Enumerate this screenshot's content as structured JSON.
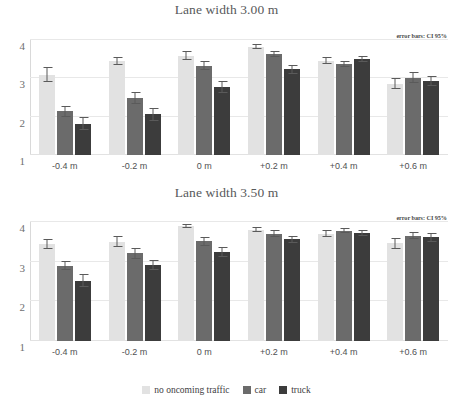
{
  "figure": {
    "legend": {
      "items": [
        {
          "label": "no oncoming traffic",
          "color": "#e2e2e2"
        },
        {
          "label": "car",
          "color": "#6b6b6b"
        },
        {
          "label": "truck",
          "color": "#3c3c3c"
        }
      ]
    },
    "annotation": "error bars: CI 95%"
  },
  "chart_data": [
    {
      "type": "bar",
      "title": "Lane width 3.00 m",
      "xlabel": "",
      "ylabel": "",
      "ylim": [
        1,
        4
      ],
      "yticks": [
        1,
        2,
        3,
        4
      ],
      "ytick_labels": [
        "1",
        "2",
        "3",
        "4"
      ],
      "grid": true,
      "legend_position": "bottom",
      "annotation": "error bars: CI 95%",
      "categories": [
        "-0.4 m",
        "-0.2 m",
        "0 m",
        "+0.2 m",
        "+0.4 m",
        "+0.6 m"
      ],
      "series": [
        {
          "name": "no oncoming traffic",
          "color": "#e2e2e2",
          "values": [
            3.08,
            3.45,
            3.58,
            3.82,
            3.46,
            2.86
          ],
          "err_low": [
            2.9,
            3.36,
            3.47,
            3.76,
            3.38,
            2.71
          ],
          "err_high": [
            3.3,
            3.55,
            3.72,
            3.89,
            3.55,
            3.02
          ]
        },
        {
          "name": "car",
          "color": "#6b6b6b",
          "values": [
            2.14,
            2.48,
            3.33,
            3.63,
            3.38,
            3.01
          ],
          "err_low": [
            2.0,
            2.32,
            3.22,
            3.55,
            3.3,
            2.87
          ],
          "err_high": [
            2.29,
            2.65,
            3.45,
            3.71,
            3.46,
            3.16
          ]
        },
        {
          "name": "truck",
          "color": "#3c3c3c",
          "values": [
            1.82,
            2.06,
            2.77,
            3.24,
            3.5,
            2.94
          ],
          "err_low": [
            1.66,
            1.9,
            2.63,
            3.12,
            3.42,
            2.81
          ],
          "err_high": [
            1.98,
            2.22,
            2.92,
            3.36,
            3.58,
            3.07
          ]
        }
      ]
    },
    {
      "type": "bar",
      "title": "Lane width 3.50 m",
      "xlabel": "",
      "ylabel": "",
      "ylim": [
        1,
        4
      ],
      "yticks": [
        1,
        2,
        3,
        4
      ],
      "ytick_labels": [
        "1",
        "2",
        "3",
        "4"
      ],
      "grid": true,
      "legend_position": "bottom",
      "annotation": "error bars: CI 95%",
      "categories": [
        "-0.4 m",
        "-0.2 m",
        "0 m",
        "+0.2 m",
        "+0.4 m",
        "+0.6 m"
      ],
      "series": [
        {
          "name": "no oncoming traffic",
          "color": "#e2e2e2",
          "values": [
            3.45,
            3.5,
            3.89,
            3.81,
            3.71,
            3.47
          ],
          "err_low": [
            3.32,
            3.36,
            3.84,
            3.74,
            3.63,
            3.33
          ],
          "err_high": [
            3.58,
            3.65,
            3.94,
            3.88,
            3.79,
            3.6
          ]
        },
        {
          "name": "car",
          "color": "#6b6b6b",
          "values": [
            2.89,
            3.21,
            3.51,
            3.71,
            3.78,
            3.66
          ],
          "err_low": [
            2.78,
            3.08,
            3.4,
            3.63,
            3.72,
            3.56
          ],
          "err_high": [
            3.01,
            3.34,
            3.62,
            3.79,
            3.84,
            3.76
          ]
        },
        {
          "name": "truck",
          "color": "#3c3c3c",
          "values": [
            2.52,
            2.91,
            3.25,
            3.56,
            3.73,
            3.61
          ],
          "err_low": [
            2.36,
            2.79,
            3.13,
            3.48,
            3.66,
            3.5
          ],
          "err_high": [
            2.68,
            3.03,
            3.37,
            3.64,
            3.8,
            3.72
          ]
        }
      ]
    }
  ]
}
